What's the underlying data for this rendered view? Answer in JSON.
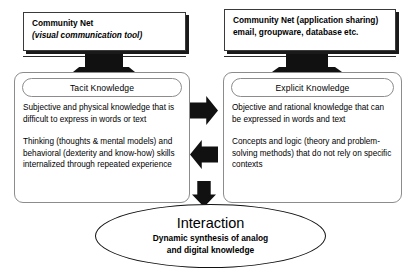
{
  "diagram": {
    "monitors": [
      {
        "id": "community-net-visual",
        "lines": [
          {
            "text": "Community Net",
            "italic": false
          },
          {
            "text": "(visual communication tool)",
            "italic": true
          }
        ]
      },
      {
        "id": "community-net-apps",
        "lines": [
          {
            "text": "Community Net  (application sharing)",
            "italic": false
          },
          {
            "text": "email, groupware, database etc.",
            "italic": false
          }
        ]
      }
    ],
    "panels": {
      "tacit": {
        "title": "Tacit Knowledge",
        "paragraphs": [
          "Subjective and physical knowledge that is difficult to express in words or text",
          "Thinking (thoughts & mental models) and behavioral (dexterity and know-how) skills internalized through repeated experience"
        ]
      },
      "explicit": {
        "title": "Explicit Knowledge",
        "paragraphs": [
          "Objective and rational knowledge that can be expressed in words and text",
          "Concepts and logic (theory and problem-solving methods) that do not rely on specific contexts"
        ]
      }
    },
    "interaction": {
      "title": "Interaction",
      "subtitle_line1": "Dynamic synthesis of analog",
      "subtitle_line2": "and digital knowledge"
    },
    "colors": {
      "ink": "#000000",
      "solid_fill": "#111111",
      "panel_border": "#8c8c8c",
      "background": "#ffffff"
    }
  }
}
